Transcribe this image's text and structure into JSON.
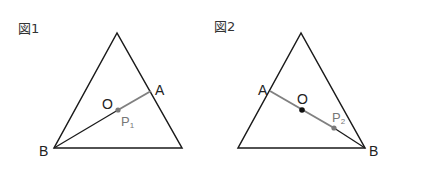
{
  "figures": [
    {
      "title": "図1",
      "points": {
        "A": "A",
        "B": "B",
        "O": "O",
        "P": "P",
        "P_sub": "1"
      }
    },
    {
      "title": "図2",
      "points": {
        "A": "A",
        "B": "B",
        "O": "O",
        "P": "P",
        "P_sub": "2"
      }
    }
  ],
  "colors": {
    "line_black": "#1a1a1a",
    "line_gray": "#808080",
    "point_gray": "#7a7a7a",
    "point_black": "#111111"
  }
}
